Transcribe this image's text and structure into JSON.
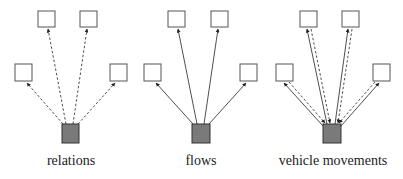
{
  "panels": [
    {
      "label": "relations",
      "edge_style": "dashed",
      "direction": "out"
    },
    {
      "label": "flows",
      "edge_style": "solid",
      "direction": "out"
    },
    {
      "label": "vehicle movements",
      "edge_style": "solid+dashed",
      "direction": "both"
    }
  ],
  "colors": {
    "node_fill": "#ffffff",
    "node_stroke": "#555555",
    "hub_fill": "#7a7a7a",
    "hub_stroke": "#333333",
    "edge": "#222222"
  }
}
